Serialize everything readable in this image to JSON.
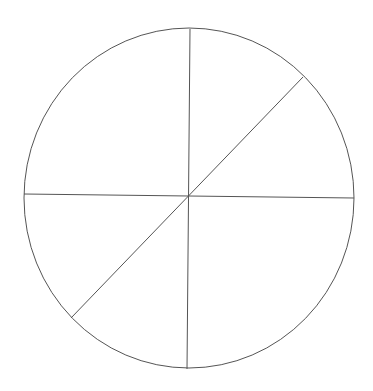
{
  "diagram": {
    "type": "divided-circle",
    "canvas": {
      "width": 373,
      "height": 391,
      "background": "#ffffff"
    },
    "stroke_color": "#555555",
    "circle": {
      "cx": 189,
      "cy": 198,
      "rx": 165,
      "ry": 170
    },
    "center": {
      "x": 189,
      "y": 196
    },
    "lines": [
      {
        "name": "vertical-divider",
        "x1": 190,
        "y1": 29,
        "x2": 187,
        "y2": 369
      },
      {
        "name": "horizontal-divider",
        "x1": 24,
        "y1": 194,
        "x2": 354,
        "y2": 198
      },
      {
        "name": "diagonal-divider",
        "x1": 303,
        "y1": 77,
        "x2": 71,
        "y2": 318
      }
    ],
    "sector_count": 6,
    "labels": []
  }
}
